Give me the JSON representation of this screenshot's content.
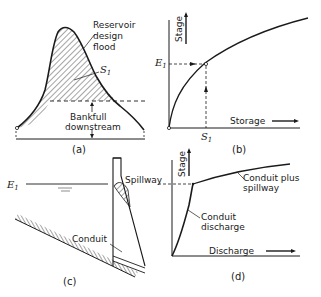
{
  "figure": {
    "panel_a": {
      "caption": "(a)",
      "label_flood": [
        "Reservoir",
        "design",
        "flood"
      ],
      "label_storage": "S",
      "label_storage_sub": "1",
      "label_bankfull": [
        "Bankfull",
        "downstream"
      ]
    },
    "panel_b": {
      "caption": "(b)",
      "y_axis": "Stage",
      "x_axis": "Storage",
      "level_label": "E",
      "level_label_sub": "1",
      "storage_label": "S",
      "storage_label_sub": "1"
    },
    "panel_c": {
      "caption": "(c)",
      "level_label": "E",
      "level_label_sub": "1",
      "spillway_label": "Spillway",
      "conduit_label": "Conduit"
    },
    "panel_d": {
      "caption": "(d)",
      "y_axis": "Stage",
      "x_axis": "Discharge",
      "curve1_label": [
        "Conduit",
        "discharge"
      ],
      "curve2_label": [
        "Conduit plus",
        "spillway"
      ]
    }
  },
  "colors": {
    "ink": "#1a1a1a",
    "background": "#ffffff"
  }
}
